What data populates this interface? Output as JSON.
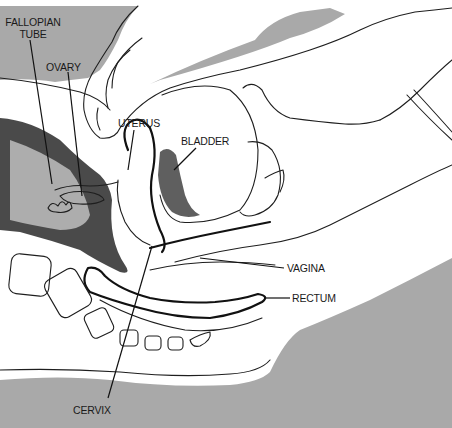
{
  "figure": {
    "background_gray": "#a9a9a9",
    "ink_color": "#1e1e1e",
    "labels": {
      "fallopian_tube_line1": "FALLOPIAN",
      "fallopian_tube_line2": "TUBE",
      "ovary": "OVARY",
      "uterus": "UTERUS",
      "bladder": "BLADDER",
      "vagina": "VAGINA",
      "rectum": "RECTUM",
      "cervix": "CERVIX"
    }
  }
}
